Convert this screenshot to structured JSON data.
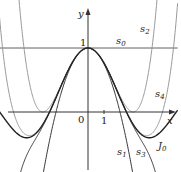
{
  "chart_data": {
    "type": "line",
    "title": "",
    "xlabel": "x",
    "ylabel": "y",
    "x_tick_labels": [
      "0",
      "1"
    ],
    "y_tick_labels": [
      "1"
    ],
    "xlim": [
      -5.5,
      5.6
    ],
    "ylim": [
      -0.95,
      1.75
    ],
    "grid": false,
    "legend": "inline curve labels",
    "series": [
      {
        "name": "s0",
        "label": "s",
        "sub": "0",
        "formula": "1",
        "coeffs": [
          1
        ],
        "color": "#444444",
        "width": 1.0
      },
      {
        "name": "s1",
        "label": "s",
        "sub": "1",
        "formula": "1 - x^2/4",
        "coeffs": [
          1,
          -0.25
        ],
        "color": "#333333",
        "width": 1.0
      },
      {
        "name": "s2",
        "label": "s",
        "sub": "2",
        "formula": "1 - x^2/4 + x^4/64",
        "coeffs": [
          1,
          -0.25,
          0.015625
        ],
        "color": "#999999",
        "width": 1.0
      },
      {
        "name": "s3",
        "label": "s",
        "sub": "3",
        "formula": "1 - x^2/4 + x^4/64 - x^6/2304",
        "coeffs": [
          1,
          -0.25,
          0.015625,
          -0.000434028
        ],
        "color": "#333333",
        "width": 1.0
      },
      {
        "name": "s4",
        "label": "s",
        "sub": "4",
        "formula": "1 - x^2/4 + x^4/64 - x^6/2304 + x^8/147456",
        "coeffs": [
          1,
          -0.25,
          0.015625,
          -0.000434028,
          6.78168e-06
        ],
        "color": "#999999",
        "width": 1.0
      },
      {
        "name": "J0",
        "label": "J",
        "sub": "0",
        "formula": "Bessel J0(x)",
        "color": "#222222",
        "width": 1.4
      }
    ]
  },
  "labels": {
    "y_axis": "y",
    "x_axis": "x",
    "origin": "0",
    "x_tick_1": "1",
    "y_tick_1": "1",
    "s0": "s",
    "s0_sub": "0",
    "s1": "s",
    "s1_sub": "1",
    "s2": "s",
    "s2_sub": "2",
    "s3": "s",
    "s3_sub": "3",
    "s4": "s",
    "s4_sub": "4",
    "J0": "J",
    "J0_sub": "0"
  }
}
